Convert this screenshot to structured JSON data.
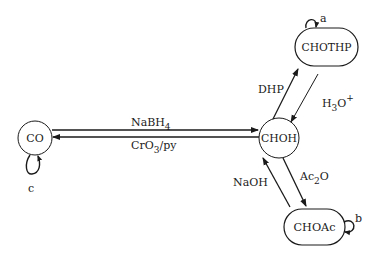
{
  "diagram": {
    "type": "reaction-state-diagram",
    "colors": {
      "stroke": "#1a1a1a",
      "background": "#ffffff"
    },
    "nodes": [
      {
        "id": "CO",
        "label": "CO",
        "shape": "circle"
      },
      {
        "id": "CHOH",
        "label": "CHOH",
        "shape": "circle"
      },
      {
        "id": "CHOTHP",
        "label": "CHOTHP",
        "shape": "rounded-rect"
      },
      {
        "id": "CHOAc",
        "label": "CHOAc",
        "shape": "rounded-rect"
      }
    ],
    "edges": [
      {
        "from": "CO",
        "to": "CHOH",
        "label_main": "NaBH",
        "label_sub": "4",
        "label_after": ""
      },
      {
        "from": "CHOH",
        "to": "CO",
        "label_main": "CrO",
        "label_sub": "3",
        "label_after": "/py"
      },
      {
        "from": "CHOH",
        "to": "CHOTHP",
        "label_main": "DHP",
        "label_sub": "",
        "label_after": ""
      },
      {
        "from": "CHOTHP",
        "to": "CHOH",
        "label_main": "H",
        "label_sub": "3",
        "label_after": "O",
        "label_sup": "+"
      },
      {
        "from": "CHOH",
        "to": "CHOAc",
        "label_main": "Ac",
        "label_sub": "2",
        "label_after": "O"
      },
      {
        "from": "CHOAc",
        "to": "CHOH",
        "label_main": "NaOH",
        "label_sub": "",
        "label_after": ""
      }
    ],
    "self_loops": [
      {
        "node": "CHOTHP",
        "label": "a"
      },
      {
        "node": "CHOAc",
        "label": "b"
      },
      {
        "node": "CO",
        "label": "c"
      }
    ]
  }
}
